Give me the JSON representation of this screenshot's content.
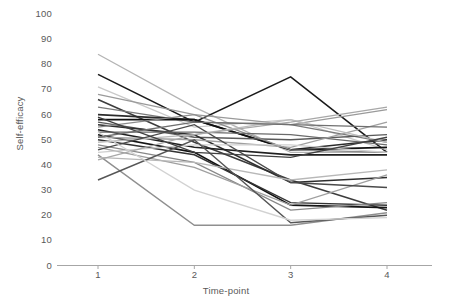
{
  "chart_data": {
    "type": "line",
    "title": "",
    "xlabel": "Time-point",
    "ylabel": "Self-efficacy",
    "x": [
      1,
      2,
      3,
      4
    ],
    "categories": [
      "1",
      "2",
      "3",
      "4"
    ],
    "xtick_labels": [
      "1",
      "2",
      "3",
      "4"
    ],
    "ytick_labels": [
      "0",
      "10",
      "20",
      "30",
      "40",
      "50",
      "60",
      "70",
      "80",
      "90",
      "100"
    ],
    "ytick_values": [
      0,
      10,
      20,
      30,
      40,
      50,
      60,
      70,
      80,
      90,
      100
    ],
    "ylim": [
      0,
      100
    ],
    "xlim": [
      0.62,
      4.46
    ],
    "grid": false,
    "legend": false,
    "legend_position": "none",
    "axis_color": "#a6a6a6",
    "tick_label_color": "#595959",
    "background": "#ffffff",
    "series": [
      {
        "name": "p01",
        "values": [
          84,
          63,
          45,
          45
        ],
        "color": "#b4b4b4",
        "width": 1.3
      },
      {
        "name": "p02",
        "values": [
          76,
          57,
          75,
          45
        ],
        "color": "#1a1a1a",
        "width": 1.6
      },
      {
        "name": "p03",
        "values": [
          71,
          55,
          58,
          46
        ],
        "color": "#c9c9c9",
        "width": 1.3
      },
      {
        "name": "p04",
        "values": [
          68,
          60,
          56,
          62
        ],
        "color": "#9a9a9a",
        "width": 1.3
      },
      {
        "name": "p05",
        "values": [
          66,
          49,
          34,
          22
        ],
        "color": "#3c3c3c",
        "width": 1.5
      },
      {
        "name": "p06",
        "values": [
          63,
          57,
          56,
          49
        ],
        "color": "#7a7a7a",
        "width": 1.3
      },
      {
        "name": "p07",
        "values": [
          60,
          58,
          46,
          50
        ],
        "color": "#2b2b2b",
        "width": 1.6
      },
      {
        "name": "p08",
        "values": [
          58,
          58,
          46,
          47
        ],
        "color": "#111111",
        "width": 1.8
      },
      {
        "name": "p09",
        "values": [
          57,
          51,
          50,
          52
        ],
        "color": "#5a5a5a",
        "width": 1.3
      },
      {
        "name": "p10",
        "values": [
          56,
          52,
          33,
          35
        ],
        "color": "#2f2f2f",
        "width": 1.5
      },
      {
        "name": "p11",
        "values": [
          55,
          60,
          46,
          45
        ],
        "color": "#8c8c8c",
        "width": 1.3
      },
      {
        "name": "p12",
        "values": [
          54,
          47,
          44,
          44
        ],
        "color": "#1f1f1f",
        "width": 1.6
      },
      {
        "name": "p13",
        "values": [
          53,
          53,
          52,
          48
        ],
        "color": "#6b6b6b",
        "width": 1.3
      },
      {
        "name": "p14",
        "values": [
          52,
          45,
          24,
          23
        ],
        "color": "#141414",
        "width": 1.7
      },
      {
        "name": "p15",
        "values": [
          51,
          50,
          47,
          57
        ],
        "color": "#a0a0a0",
        "width": 1.3
      },
      {
        "name": "p16",
        "values": [
          50,
          44,
          25,
          24
        ],
        "color": "#333333",
        "width": 1.5
      },
      {
        "name": "p17",
        "values": [
          49,
          52,
          58,
          49
        ],
        "color": "#bcbcbc",
        "width": 1.3
      },
      {
        "name": "p18",
        "values": [
          48,
          41,
          22,
          25
        ],
        "color": "#888888",
        "width": 1.3
      },
      {
        "name": "p19",
        "values": [
          47,
          39,
          24,
          36
        ],
        "color": "#9f9f9f",
        "width": 1.3
      },
      {
        "name": "p20",
        "values": [
          46,
          56,
          33,
          31
        ],
        "color": "#4a4a4a",
        "width": 1.4
      },
      {
        "name": "p21",
        "values": [
          45,
          48,
          48,
          45
        ],
        "color": "#cfcfcf",
        "width": 1.3
      },
      {
        "name": "p22",
        "values": [
          44,
          16,
          16,
          21
        ],
        "color": "#8f8f8f",
        "width": 1.4
      },
      {
        "name": "p23",
        "values": [
          43,
          41,
          34,
          38
        ],
        "color": "#b8b8b8",
        "width": 1.3
      },
      {
        "name": "p24",
        "values": [
          42,
          52,
          57,
          63
        ],
        "color": "#a8a8a8",
        "width": 1.3
      },
      {
        "name": "p25",
        "values": [
          34,
          50,
          17,
          20
        ],
        "color": "#565656",
        "width": 1.5
      },
      {
        "name": "p26",
        "values": [
          53,
          30,
          18,
          19
        ],
        "color": "#d2d2d2",
        "width": 1.3
      },
      {
        "name": "p27",
        "values": [
          59,
          45,
          43,
          51
        ],
        "color": "#404040",
        "width": 1.4
      },
      {
        "name": "p28",
        "values": [
          51,
          57,
          56,
          55
        ],
        "color": "#707070",
        "width": 1.3
      }
    ]
  }
}
